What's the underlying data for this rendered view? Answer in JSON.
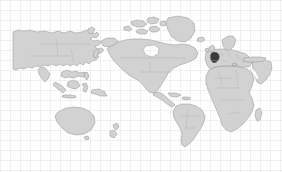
{
  "figure": {
    "kind": "world-map",
    "width": 282,
    "height": 172,
    "background_color": "#ffffff",
    "grid_visible": true,
    "grid_spacing_px": 10,
    "grid_color": "#d0d0d0"
  },
  "map": {
    "projection": "equirectangular",
    "centering": "pacific-centered",
    "land_fill_color": "#d2d2d2",
    "land_outline_color": "#8c8c8c",
    "internal_border_color": "#a6a6a6",
    "antarctica_shown": false,
    "labels_shown": false,
    "graticule_shown": false,
    "content_bounds": {
      "left": 13,
      "top": 13,
      "right": 272,
      "bottom": 150
    }
  },
  "highlight": {
    "name": "highlighted-country",
    "region": "Western Europe",
    "fill_color": "#3b3b3b",
    "outline_color": "#2a2a2a",
    "center_px": {
      "x": 215,
      "y": 58
    },
    "approx_size_px": {
      "width": 9,
      "height": 10
    }
  },
  "regions": [
    {
      "id": "eurasia-west",
      "label": "Eurasia (Russia / Asia, left side)"
    },
    {
      "id": "north-america",
      "label": "North America"
    },
    {
      "id": "arctic-archipelago",
      "label": "Canadian Arctic Archipelago"
    },
    {
      "id": "greenland",
      "label": "Greenland"
    },
    {
      "id": "central-america",
      "label": "Central America and Caribbean"
    },
    {
      "id": "south-america",
      "label": "South America"
    },
    {
      "id": "africa",
      "label": "Africa"
    },
    {
      "id": "europe",
      "label": "Europe"
    },
    {
      "id": "middle-east",
      "label": "Middle East and Arabian Peninsula"
    },
    {
      "id": "australia",
      "label": "Australia"
    },
    {
      "id": "new-zealand",
      "label": "New Zealand"
    },
    {
      "id": "southeast-asia",
      "label": "Southeast Asia and Indonesia"
    },
    {
      "id": "japan",
      "label": "Japan"
    },
    {
      "id": "madagascar",
      "label": "Madagascar"
    },
    {
      "id": "iceland",
      "label": "Iceland"
    },
    {
      "id": "british-isles",
      "label": "British Isles"
    }
  ]
}
